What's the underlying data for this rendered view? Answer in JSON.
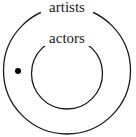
{
  "diagram": {
    "type": "euler-diagram",
    "sets": [
      {
        "name": "outer-set",
        "label": "artists",
        "cx": 67,
        "cy": 70.5,
        "r": 63.5,
        "label_x": 67,
        "label_y": 12
      },
      {
        "name": "inner-set",
        "label": "actors",
        "cx": 67,
        "cy": 73.5,
        "r": 35.5,
        "label_x": 67,
        "label_y": 43
      }
    ],
    "points": [
      {
        "name": "element-dot",
        "cx": 18,
        "cy": 71,
        "r": 3
      }
    ],
    "colors": {
      "stroke": "#1a1a1a",
      "background": "#ffffff",
      "dot": "#000000"
    }
  }
}
